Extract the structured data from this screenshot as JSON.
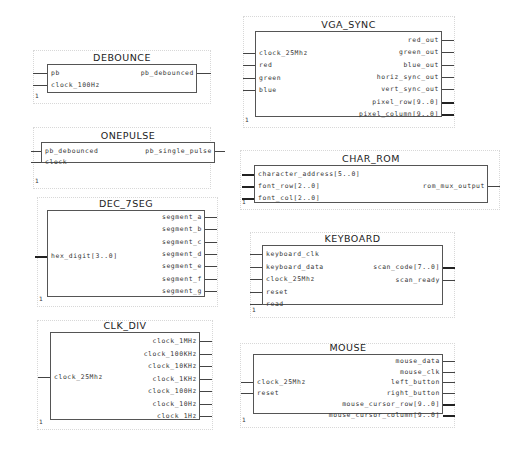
{
  "blocks": [
    {
      "id": "debounce",
      "title": "DEBOUNCE",
      "instance": "1",
      "inputs": [
        {
          "name": "pb",
          "bus": false
        },
        {
          "name": "clock_100Hz",
          "bus": false
        }
      ],
      "outputs": [
        {
          "name": "pb_debounced",
          "bus": false
        }
      ]
    },
    {
      "id": "onepulse",
      "title": "ONEPULSE",
      "instance": "1",
      "inputs": [
        {
          "name": "pb_debounced",
          "bus": false
        },
        {
          "name": "clock",
          "bus": false
        }
      ],
      "outputs": [
        {
          "name": "pb_single_pulse",
          "bus": false
        }
      ]
    },
    {
      "id": "dec-7seg",
      "title": "DEC_7SEG",
      "instance": "1",
      "inputs": [
        {
          "name": "hex_digit[3..0]",
          "bus": true
        }
      ],
      "outputs": [
        {
          "name": "segment_a",
          "bus": false
        },
        {
          "name": "segment_b",
          "bus": false
        },
        {
          "name": "segment_c",
          "bus": false
        },
        {
          "name": "segment_d",
          "bus": false
        },
        {
          "name": "segment_e",
          "bus": false
        },
        {
          "name": "segment_f",
          "bus": false
        },
        {
          "name": "segment_g",
          "bus": false
        }
      ]
    },
    {
      "id": "clk-div",
      "title": "CLK_DIV",
      "instance": "1",
      "inputs": [
        {
          "name": "clock_25Mhz",
          "bus": false
        }
      ],
      "outputs": [
        {
          "name": "clock_1MHz",
          "bus": false
        },
        {
          "name": "clock_100KHz",
          "bus": false
        },
        {
          "name": "clock_10KHz",
          "bus": false
        },
        {
          "name": "clock_1KHz",
          "bus": false
        },
        {
          "name": "clock_100Hz",
          "bus": false
        },
        {
          "name": "clock_10Hz",
          "bus": false
        },
        {
          "name": "clock_1Hz",
          "bus": false
        }
      ]
    },
    {
      "id": "vga-sync",
      "title": "VGA_SYNC",
      "instance": "1",
      "inputs": [
        {
          "name": "clock_25Mhz",
          "bus": false
        },
        {
          "name": "red",
          "bus": false
        },
        {
          "name": "green",
          "bus": false
        },
        {
          "name": "blue",
          "bus": false
        }
      ],
      "outputs": [
        {
          "name": "red_out",
          "bus": false
        },
        {
          "name": "green_out",
          "bus": false
        },
        {
          "name": "blue_out",
          "bus": false
        },
        {
          "name": "horiz_sync_out",
          "bus": false
        },
        {
          "name": "vert_sync_out",
          "bus": false
        },
        {
          "name": "pixel_row[9..0]",
          "bus": true
        },
        {
          "name": "pixel_column[9..0]",
          "bus": true
        }
      ]
    },
    {
      "id": "char-rom",
      "title": "CHAR_ROM",
      "instance": "1",
      "inputs": [
        {
          "name": "character_address[5..0]",
          "bus": true
        },
        {
          "name": "font_row[2..0]",
          "bus": true
        },
        {
          "name": "font_col[2..0]",
          "bus": true
        }
      ],
      "outputs": [
        {
          "name": "rom_mux_output",
          "bus": false
        }
      ]
    },
    {
      "id": "keyboard",
      "title": "KEYBOARD",
      "instance": "1",
      "inputs": [
        {
          "name": "keyboard_clk",
          "bus": false
        },
        {
          "name": "keyboard_data",
          "bus": false
        },
        {
          "name": "clock_25Mhz",
          "bus": false
        },
        {
          "name": "reset",
          "bus": false
        },
        {
          "name": "read",
          "bus": false
        }
      ],
      "outputs": [
        {
          "name": "scan_code[7..0]",
          "bus": true
        },
        {
          "name": "scan_ready",
          "bus": false
        }
      ]
    },
    {
      "id": "mouse",
      "title": "MOUSE",
      "instance": "1",
      "inputs": [
        {
          "name": "clock_25Mhz",
          "bus": false
        },
        {
          "name": "reset",
          "bus": false
        }
      ],
      "outputs": [
        {
          "name": "mouse_data",
          "bus": false
        },
        {
          "name": "mouse_clk",
          "bus": false
        },
        {
          "name": "left_button",
          "bus": false
        },
        {
          "name": "right_button",
          "bus": false
        },
        {
          "name": "mouse_cursor_row[9..0]",
          "bus": true
        },
        {
          "name": "mouse_cursor_column[9..0]",
          "bus": true
        }
      ]
    }
  ]
}
